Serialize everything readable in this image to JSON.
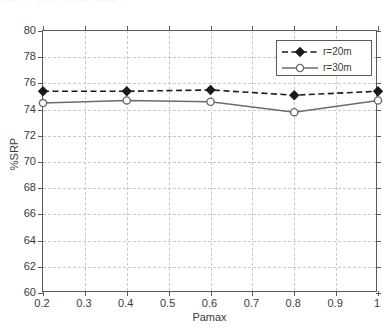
{
  "figure": {
    "top_caption_fragment": "igure  ...  %SRP versus Pamax  ...",
    "background_color": "#ffffff",
    "axis_color": "#5a5a5a",
    "grid_color": "#c8c8c8"
  },
  "chart_data": {
    "type": "line",
    "title": "",
    "subtitle": "",
    "xlabel": "Pamax",
    "ylabel": "%SRP",
    "xlim": [
      0.2,
      1.0
    ],
    "ylim": [
      60,
      80
    ],
    "xticks": [
      0.2,
      0.3,
      0.4,
      0.5,
      0.6,
      0.7,
      0.8,
      0.9,
      1.0
    ],
    "xtick_labels": [
      "0.2",
      "0.3",
      "0.4",
      "0.5",
      "0.6",
      "0.7",
      "0.8",
      "0.9",
      "1"
    ],
    "yticks": [
      60,
      62,
      64,
      66,
      68,
      70,
      72,
      74,
      76,
      78,
      80
    ],
    "ytick_labels": [
      "60",
      "62",
      "64",
      "66",
      "68",
      "70",
      "72",
      "74",
      "76",
      "78",
      "80"
    ],
    "grid": true,
    "grid_style": "dashed",
    "legend_position": "upper right",
    "x": [
      0.2,
      0.4,
      0.6,
      0.8,
      1.0
    ],
    "series": [
      {
        "name": "r=20m",
        "values": [
          75.4,
          75.4,
          75.5,
          75.1,
          75.4
        ],
        "color": "#1a1a1a",
        "line_style": "dashed",
        "marker": "diamond"
      },
      {
        "name": "r=30m",
        "values": [
          74.5,
          74.7,
          74.6,
          73.8,
          74.7
        ],
        "color": "#6b6b6b",
        "line_style": "solid",
        "marker": "circle"
      }
    ]
  },
  "legend": {
    "entries": [
      {
        "label": "r=20m"
      },
      {
        "label": "r=30m"
      }
    ]
  }
}
